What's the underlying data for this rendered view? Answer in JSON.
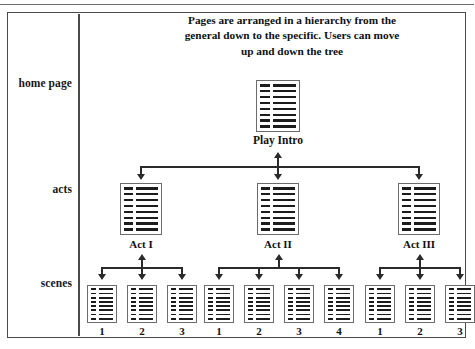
{
  "figure": {
    "caption": "Pages are arranged in a hierarchy from the general down to the specific. Users can move up and down the tree",
    "row_labels": {
      "home": "home page",
      "acts": "acts",
      "scenes": "scenes"
    },
    "colors": {
      "ink": "#1c1c1c",
      "frame": "#4a4a4a",
      "connector": "#2a2a2a",
      "page_border": "#6b6b6b",
      "background": "#ffffff"
    }
  },
  "tree": {
    "root": {
      "label": "Play Intro",
      "icon": "page-icon"
    },
    "acts": [
      {
        "label": "Act I",
        "icon": "page-icon",
        "scenes": [
          {
            "label": "1",
            "icon": "page-icon"
          },
          {
            "label": "2",
            "icon": "page-icon"
          },
          {
            "label": "3",
            "icon": "page-icon"
          }
        ]
      },
      {
        "label": "Act II",
        "icon": "page-icon",
        "scenes": [
          {
            "label": "1",
            "icon": "page-icon"
          },
          {
            "label": "2",
            "icon": "page-icon"
          },
          {
            "label": "3",
            "icon": "page-icon"
          },
          {
            "label": "4",
            "icon": "page-icon"
          }
        ]
      },
      {
        "label": "Act III",
        "icon": "page-icon",
        "scenes": [
          {
            "label": "1",
            "icon": "page-icon"
          },
          {
            "label": "2",
            "icon": "page-icon"
          },
          {
            "label": "3",
            "icon": "page-icon"
          }
        ]
      }
    ]
  }
}
